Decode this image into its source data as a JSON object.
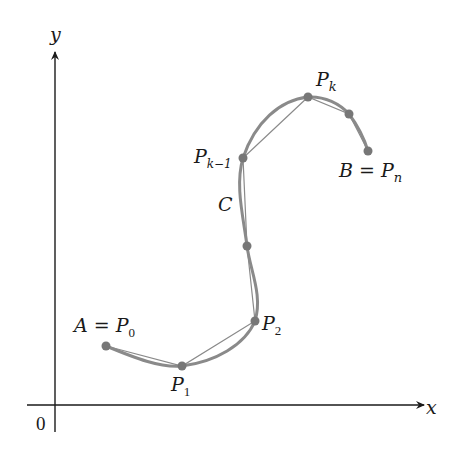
{
  "diagram": {
    "axes": {
      "x_label": "x",
      "y_label": "y",
      "origin_label": "0"
    },
    "curve_label": "C",
    "points": [
      {
        "id": "P0",
        "label_main": "A = P",
        "label_sub": "0"
      },
      {
        "id": "P1",
        "label_main": "P",
        "label_sub": "1"
      },
      {
        "id": "P2",
        "label_main": "P",
        "label_sub": "2"
      },
      {
        "id": "Pk-1",
        "label_main": "P",
        "label_sub": "k−1"
      },
      {
        "id": "Pk",
        "label_main": "P",
        "label_sub": "k"
      },
      {
        "id": "Pn",
        "label_main": "B = P",
        "label_sub": "n"
      }
    ],
    "colors": {
      "curve": "#8a8a8a",
      "chord": "#8a8a8a",
      "point": "#777777",
      "axis": "#1a1a1a"
    }
  }
}
